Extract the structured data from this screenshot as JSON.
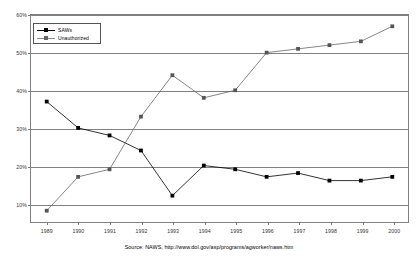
{
  "chart_data": {
    "type": "line",
    "title": "",
    "xlabel": "",
    "ylabel": "",
    "categories": [
      "1989",
      "1990",
      "1991",
      "1992",
      "1993",
      "1994",
      "1995",
      "1996",
      "1997",
      "1998",
      "1999",
      "2000"
    ],
    "ylim": [
      5,
      60
    ],
    "yticks": [
      "10%",
      "20%",
      "30%",
      "40%",
      "50%",
      "60%"
    ],
    "ytick_values": [
      10,
      20,
      30,
      40,
      50,
      60
    ],
    "grid": true,
    "legend_position": "upper-left",
    "series": [
      {
        "name": "SAWs",
        "color": "#000000",
        "marker": "square",
        "values": [
          37,
          30,
          28,
          24,
          12,
          20,
          19,
          17,
          18,
          16,
          16,
          17
        ]
      },
      {
        "name": "Unauthorized",
        "color": "#666666",
        "marker": "square",
        "values": [
          8,
          17,
          19,
          33,
          44,
          38,
          40,
          50,
          51,
          52,
          53,
          57
        ]
      }
    ],
    "source_label": "Source:",
    "source_name": "NAWS,",
    "source_url": "http://www.dol.gov/asp/programs/agworker/naws.htm",
    "source_full": "Source: NAWS, http://www.dol.gov/asp/programs/agworker/naws.htm"
  },
  "legend": {
    "items": [
      {
        "label": "SAWs"
      },
      {
        "label": "Unauthorized"
      }
    ]
  }
}
